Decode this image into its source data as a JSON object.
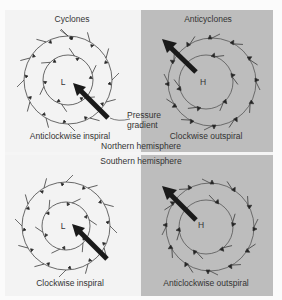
{
  "columns": {
    "left_title": "Cyclones",
    "right_title": "Anticyclones"
  },
  "rows": {
    "northern": "Northern hemisphere",
    "southern": "Southern hemisphere"
  },
  "annotation": {
    "pressure_gradient_line1": "Pressure",
    "pressure_gradient_line2": "gradient"
  },
  "panels": [
    {
      "id": "nh-cyclone",
      "center_label": "L",
      "caption": "Anticlockwise inspiral"
    },
    {
      "id": "nh-anticyclone",
      "center_label": "H",
      "caption": "Clockwise outspiral"
    },
    {
      "id": "sh-cyclone",
      "center_label": "L",
      "caption": "Clockwise inspiral"
    },
    {
      "id": "sh-anticyclone",
      "center_label": "H",
      "caption": "Anticlockwise outspiral"
    }
  ],
  "colors": {
    "cyclone_bg": "#f3f3f3",
    "anticyclone_bg": "#bdbdbd",
    "arrow": "#1a1a1a"
  }
}
